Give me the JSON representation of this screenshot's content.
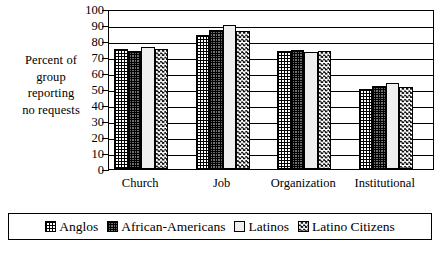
{
  "chart_data": {
    "type": "bar",
    "title": "",
    "subtitle": "",
    "xlabel": "",
    "ylabel": "Percent of group reporting no requests",
    "ylabel_lines": [
      "Percent of",
      "group",
      "reporting",
      "no requests"
    ],
    "categories": [
      "Church",
      "Job",
      "Organization",
      "Institutional"
    ],
    "series": [
      {
        "name": "Anglos",
        "values": [
          75,
          83.5,
          73.5,
          50
        ]
      },
      {
        "name": "African-Americans",
        "values": [
          74,
          87,
          74.5,
          52
        ]
      },
      {
        "name": "Latinos",
        "values": [
          76,
          90,
          73,
          53.5
        ]
      },
      {
        "name": "Latino Citizens",
        "values": [
          75,
          86.5,
          74,
          51
        ]
      }
    ],
    "ylim": [
      0,
      100
    ],
    "ytick_values": [
      0,
      10,
      20,
      30,
      40,
      50,
      60,
      70,
      80,
      90,
      100
    ],
    "ytick_labels": [
      "0",
      "10",
      "20",
      "30",
      "40",
      "50",
      "60",
      "70",
      "80",
      "90",
      "100"
    ],
    "grid": true,
    "grid_axis": "y",
    "legend_position": "bottom",
    "patterns": [
      "light-grid",
      "dense-dark-grid",
      "light-dotted",
      "checkerboard"
    ],
    "colors": {
      "axis": "#000000",
      "grid": "#000000",
      "plot_background": "#ffffff",
      "figure_background": "#ffffff",
      "text": "#000000"
    }
  },
  "legend": {
    "items": [
      {
        "label": "Anglos",
        "pattern": "light-grid"
      },
      {
        "label": "African-Americans",
        "pattern": "dense-dark-grid"
      },
      {
        "label": "Latinos",
        "pattern": "light-dotted"
      },
      {
        "label": "Latino Citizens",
        "pattern": "checkerboard"
      }
    ]
  }
}
